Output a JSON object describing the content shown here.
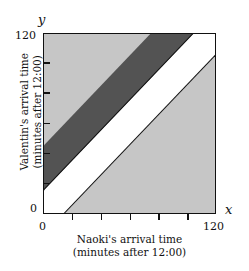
{
  "figure": {
    "kind": "geometric-probability-diagram",
    "axis_letters": {
      "x": "x",
      "y": "y"
    }
  },
  "axes": {
    "x": {
      "title_line1": "Naoki's arrival time",
      "title_line2": "(minutes after 12:00)",
      "min_label": "0",
      "max_label": "120",
      "ticks": [
        0,
        20,
        40,
        60,
        80,
        100,
        120
      ]
    },
    "y": {
      "title_line1": "Valentin's arrival time",
      "title_line2": "(minutes after 12:00)",
      "min_label": "0",
      "max_label": "120",
      "ticks": [
        0,
        20,
        40,
        60,
        80,
        100,
        120
      ]
    }
  },
  "colors": {
    "light_gray": "#c6c6c6",
    "dark_gray": "#535353",
    "white": "#ffffff",
    "outline": "#111111",
    "background": "#ffffff"
  },
  "chart_data": {
    "type": "area",
    "title": "",
    "subtitle": "",
    "xlabel": "Naoki's arrival time (minutes after 12:00)",
    "ylabel": "Valentin's arrival time (minutes after 12:00)",
    "xlim": [
      0,
      120
    ],
    "ylim": [
      0,
      120
    ],
    "xticks": [
      0,
      20,
      40,
      60,
      80,
      100,
      120
    ],
    "yticks": [
      0,
      20,
      40,
      60,
      80,
      100,
      120
    ],
    "xticklabels": [
      "0",
      "",
      "",
      "",
      "",
      "",
      "120"
    ],
    "yticklabels": [
      "0",
      "",
      "",
      "",
      "",
      "",
      "120"
    ],
    "grid": false,
    "legend": null,
    "aspect": "equal",
    "regions": [
      {
        "name": "upper-light-gray",
        "fill": "#c6c6c6",
        "description": "Region above the line y = x + 45",
        "inequality": "y > x + 45",
        "boundary_lines": [
          "y = x + 45"
        ]
      },
      {
        "name": "dark-gray-band",
        "fill": "#535353",
        "description": "Diagonal band between y = x + 15 and y = x + 45",
        "inequality": "x + 15 < y < x + 45",
        "boundary_lines": [
          "y = x + 15",
          "y = x + 45"
        ],
        "band_width_minutes": 30
      },
      {
        "name": "white-band",
        "fill": "#ffffff",
        "description": "Central diagonal band where |y - x| < 15",
        "inequality": "-15 < y - x < 15",
        "boundary_lines": [
          "y = x - 15",
          "y = x + 15"
        ],
        "band_width_minutes": 30
      },
      {
        "name": "lower-light-gray",
        "fill": "#c6c6c6",
        "description": "Region below the line y = x - 15",
        "inequality": "y < x - 15",
        "boundary_lines": [
          "y = x - 15"
        ]
      }
    ],
    "lines": [
      {
        "name": "upper-dark-boundary",
        "equation": "y = x + 45",
        "slope": 1,
        "intercept": 45,
        "drawn": false
      },
      {
        "name": "dark-white-boundary",
        "equation": "y = x + 15",
        "slope": 1,
        "intercept": 15,
        "drawn": true
      },
      {
        "name": "lower-white-boundary",
        "equation": "y = x - 15",
        "slope": 1,
        "intercept": -15,
        "drawn": true
      }
    ]
  }
}
